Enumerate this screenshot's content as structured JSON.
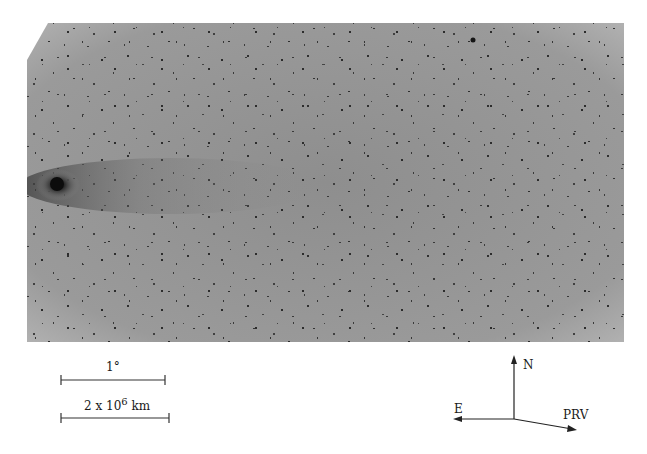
{
  "figure": {
    "image": {
      "subject": "comet-photographic-plate",
      "background_color": "#9c9c9c",
      "nucleus_color": "#111111"
    },
    "scale_bars": [
      {
        "label": "1°"
      },
      {
        "label_base": "2 x 10",
        "label_exp": "6",
        "label_unit": " km"
      }
    ],
    "compass": {
      "north_label": "N",
      "east_label": "E",
      "prv_label": "PRV"
    }
  }
}
